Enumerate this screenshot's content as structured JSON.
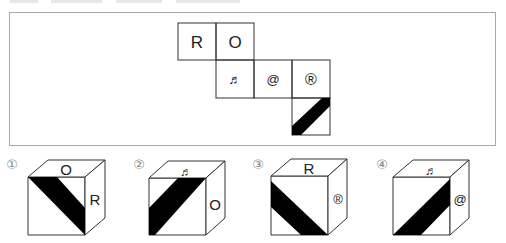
{
  "header": {
    "clipped_text_visible": false
  },
  "net": {
    "faces": [
      {
        "id": "face-r",
        "symbol": "R",
        "x": 178,
        "y": 23
      },
      {
        "id": "face-o",
        "symbol": "O",
        "x": 216,
        "y": 23
      },
      {
        "id": "face-note",
        "symbol": "♬",
        "x": 216,
        "y": 60
      },
      {
        "id": "face-at",
        "symbol": "@",
        "x": 254,
        "y": 60
      },
      {
        "id": "face-registered",
        "symbol": "®",
        "x": 292,
        "y": 60
      },
      {
        "id": "face-diagonal-band",
        "symbol": "",
        "x": 292,
        "y": 98,
        "pattern": "black diagonal band from bottom-left to top-right"
      }
    ],
    "cell_size": 38
  },
  "options": [
    {
      "label": "①",
      "top": "O",
      "right": "R",
      "front": "band from top-left to bottom-right"
    },
    {
      "label": "②",
      "top": "♬",
      "right": "O",
      "front": "band from bottom-left to top-right"
    },
    {
      "label": "③",
      "top": "R",
      "right": "®",
      "front": "band from left edge to bottom"
    },
    {
      "label": "④",
      "top": "♬",
      "right": "@",
      "front": "band from bottom-left to right edge"
    }
  ],
  "colors": {
    "frame": "#a9a9a9",
    "line": "#333333",
    "band": "#000000",
    "label": "#888888"
  }
}
